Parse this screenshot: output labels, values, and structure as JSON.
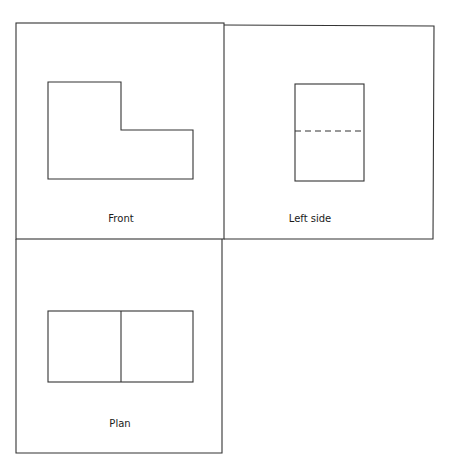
{
  "diagram": {
    "type": "orthographic-projection",
    "line_color": "#333333",
    "views": [
      {
        "id": "front",
        "label": "Front",
        "frame": {
          "x": 16,
          "y": 23,
          "w": 208,
          "h": 216
        },
        "outline_points": "48,82 121,82 121,130 193,130 193,179 48,179",
        "label_pos": {
          "x": 121,
          "y": 222
        }
      },
      {
        "id": "left-side",
        "label": "Left side",
        "frame": {
          "x": 224,
          "y": 25,
          "w": 210,
          "h": 214
        },
        "rect": {
          "x": 295,
          "y": 84,
          "w": 69,
          "h": 97
        },
        "hidden_line": {
          "x1": 295,
          "y1": 131,
          "x2": 364,
          "y2": 131
        },
        "label_pos": {
          "x": 310,
          "y": 222
        }
      },
      {
        "id": "plan",
        "label": "Plan",
        "frame": {
          "x": 16,
          "y": 239,
          "w": 206,
          "h": 214
        },
        "rect": {
          "x": 48,
          "y": 311,
          "w": 145,
          "h": 71
        },
        "divider": {
          "x1": 121,
          "y1": 311,
          "x2": 121,
          "y2": 382
        },
        "label_pos": {
          "x": 120,
          "y": 427
        }
      }
    ]
  }
}
